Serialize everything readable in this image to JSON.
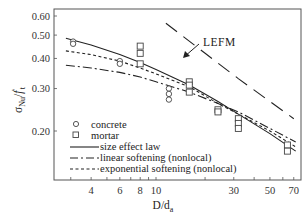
{
  "chart_data": {
    "type": "scatter",
    "title": "",
    "xlabel": "D/d_a",
    "ylabel": "σ_Nu / f'_t",
    "xscale": "log",
    "yscale": "log",
    "xlim": [
      2.6,
      80
    ],
    "ylim": [
      0.155,
      0.63
    ],
    "grid": false,
    "legend_position": "lower-left inside",
    "x_ticks": [
      4,
      6,
      8,
      10,
      30,
      50,
      70
    ],
    "x_tick_labels": [
      "4",
      "6",
      "8",
      "10",
      "30",
      "50",
      "70"
    ],
    "y_ticks": [
      0.2,
      0.3,
      0.4,
      0.5,
      0.6
    ],
    "y_tick_labels": [
      "0.20",
      "0.30",
      "0.40",
      "0.50",
      "0.60"
    ],
    "series": [
      {
        "name": "concrete",
        "kind": "marker",
        "marker": "circle",
        "points": [
          [
            3.1,
            0.47
          ],
          [
            3.1,
            0.46
          ],
          [
            6,
            0.39
          ],
          [
            6,
            0.38
          ],
          [
            12,
            0.3
          ],
          [
            12,
            0.285
          ],
          [
            12,
            0.27
          ]
        ]
      },
      {
        "name": "mortar",
        "kind": "marker",
        "marker": "square",
        "points": [
          [
            8,
            0.45
          ],
          [
            8,
            0.42
          ],
          [
            8,
            0.38
          ],
          [
            16,
            0.32
          ],
          [
            16,
            0.31
          ],
          [
            16,
            0.29
          ],
          [
            24,
            0.245
          ],
          [
            24,
            0.24
          ],
          [
            32,
            0.225
          ],
          [
            32,
            0.215
          ],
          [
            32,
            0.205
          ],
          [
            64,
            0.175
          ],
          [
            64,
            0.165
          ]
        ]
      },
      {
        "name": "size effect law",
        "kind": "line",
        "style": "solid",
        "points": [
          [
            2.8,
            0.485
          ],
          [
            4,
            0.455
          ],
          [
            6,
            0.415
          ],
          [
            8,
            0.385
          ],
          [
            10,
            0.36
          ],
          [
            16,
            0.31
          ],
          [
            24,
            0.265
          ],
          [
            32,
            0.235
          ],
          [
            50,
            0.195
          ],
          [
            72,
            0.165
          ]
        ]
      },
      {
        "name": "linear softening (nonlocal)",
        "kind": "line",
        "style": "long-dash-dot",
        "points": [
          [
            2.8,
            0.375
          ],
          [
            4,
            0.365
          ],
          [
            6,
            0.35
          ],
          [
            8,
            0.335
          ],
          [
            10,
            0.32
          ],
          [
            16,
            0.29
          ],
          [
            24,
            0.26
          ],
          [
            32,
            0.24
          ],
          [
            50,
            0.205
          ],
          [
            72,
            0.18
          ]
        ]
      },
      {
        "name": "exponential softening (nonlocal)",
        "kind": "line",
        "style": "short-dash",
        "points": [
          [
            2.8,
            0.43
          ],
          [
            4,
            0.415
          ],
          [
            6,
            0.39
          ],
          [
            8,
            0.365
          ],
          [
            10,
            0.345
          ],
          [
            16,
            0.305
          ],
          [
            24,
            0.26
          ],
          [
            32,
            0.235
          ],
          [
            50,
            0.2
          ],
          [
            72,
            0.172
          ]
        ]
      },
      {
        "name": "LEFM",
        "kind": "line",
        "style": "long-dash",
        "points": [
          [
            11.5,
            0.56
          ],
          [
            20,
            0.42
          ],
          [
            32,
            0.33
          ],
          [
            50,
            0.265
          ],
          [
            70,
            0.225
          ]
        ]
      }
    ],
    "annotations": [
      {
        "text": "LEFM",
        "x": 30,
        "y": 0.44,
        "arrow_to": [
          18,
          0.39
        ]
      }
    ]
  },
  "axes": {
    "y_title_main": "σ",
    "y_title_sub": "Nu",
    "y_title_slash": "/",
    "y_title_f": "f",
    "y_title_prime": "'",
    "y_title_f_sub": "t",
    "x_title_main": "D/d",
    "x_title_sub": "a"
  },
  "legend": {
    "items": [
      {
        "label": "concrete"
      },
      {
        "label": "mortar"
      },
      {
        "label": "size effect law"
      },
      {
        "label": "linear softening (nonlocal)"
      },
      {
        "label": "exponential softening (nonlocal)"
      }
    ]
  },
  "annotation_label": "LEFM"
}
